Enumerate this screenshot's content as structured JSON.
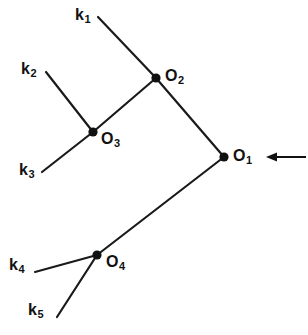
{
  "figure": {
    "kind": "tree-diagram",
    "background_color": "#ffffff",
    "line_color": "#111111",
    "width": 308,
    "height": 335
  },
  "vertices": [
    {
      "id": "O1",
      "label_base": "O",
      "label_sub": "1",
      "x": 224,
      "y": 157,
      "label_x": 233,
      "label_y": 148
    },
    {
      "id": "O2",
      "label_base": "O",
      "label_sub": "2",
      "x": 156,
      "y": 78,
      "label_x": 165,
      "label_y": 68
    },
    {
      "id": "O3",
      "label_base": "O",
      "label_sub": "3",
      "x": 93,
      "y": 132,
      "label_x": 101,
      "label_y": 131
    },
    {
      "id": "O4",
      "label_base": "O",
      "label_sub": "4",
      "x": 97,
      "y": 255,
      "label_x": 106,
      "label_y": 254
    }
  ],
  "legs": [
    {
      "id": "k1",
      "label_base": "k",
      "label_sub": "1",
      "label_x": 75,
      "label_y": 7,
      "x1": 98,
      "y1": 17,
      "x2": 156,
      "y2": 78
    },
    {
      "id": "k2",
      "label_base": "k",
      "label_sub": "2",
      "label_x": 21,
      "label_y": 61,
      "x1": 46,
      "y1": 72,
      "x2": 93,
      "y2": 132
    },
    {
      "id": "k3",
      "label_base": "k",
      "label_sub": "3",
      "label_x": 19,
      "label_y": 162,
      "x1": 42,
      "y1": 172,
      "x2": 93,
      "y2": 132
    },
    {
      "id": "k4",
      "label_base": "k",
      "label_sub": "4",
      "label_x": 9,
      "label_y": 257,
      "x1": 35,
      "y1": 272,
      "x2": 97,
      "y2": 255
    },
    {
      "id": "k5",
      "label_base": "k",
      "label_sub": "5",
      "label_x": 28,
      "label_y": 302,
      "x1": 57,
      "y1": 317,
      "x2": 97,
      "y2": 255
    }
  ],
  "internal_edges": [
    {
      "id": "O2-O1",
      "x1": 156,
      "y1": 78,
      "x2": 224,
      "y2": 157
    },
    {
      "id": "O3-O2",
      "x1": 93,
      "y1": 132,
      "x2": 156,
      "y2": 78
    },
    {
      "id": "O4-O1",
      "x1": 97,
      "y1": 255,
      "x2": 224,
      "y2": 157
    }
  ],
  "incoming_arrow": {
    "id": "incoming-arrow",
    "direction": "left",
    "tip_x": 266,
    "tail_x": 306,
    "y": 157
  }
}
